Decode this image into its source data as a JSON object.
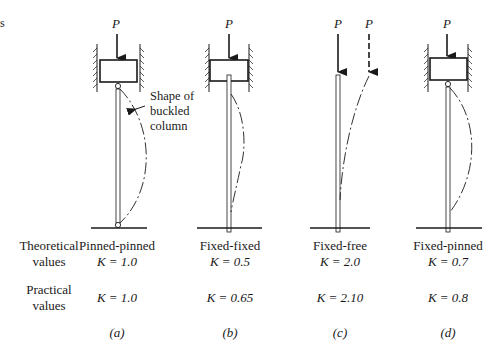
{
  "edge_text": "s",
  "load_label": "P",
  "callout": {
    "lines": [
      "Shape of",
      "buckled",
      "column"
    ]
  },
  "row_labels": {
    "theoretical": [
      "Theoretical",
      "values"
    ],
    "practical": [
      "Practical",
      "values"
    ]
  },
  "columns": [
    {
      "id": "a",
      "name": "Pinned-pinned",
      "theoretical_k": "K = 1.0",
      "practical_k": "K = 1.0",
      "tag": "(a)"
    },
    {
      "id": "b",
      "name": "Fixed-fixed",
      "theoretical_k": "K = 0.5",
      "practical_k": "K = 0.65",
      "tag": "(b)"
    },
    {
      "id": "c",
      "name": "Fixed-free",
      "theoretical_k": "K = 2.0",
      "practical_k": "K = 2.10",
      "tag": "(c)"
    },
    {
      "id": "d",
      "name": "Fixed-pinned",
      "theoretical_k": "K = 0.7",
      "practical_k": "K = 0.8",
      "tag": "(d)"
    }
  ]
}
